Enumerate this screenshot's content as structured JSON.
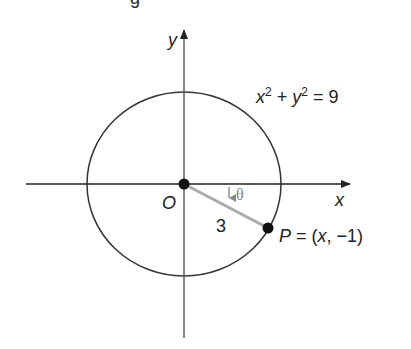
{
  "diagram": {
    "top_partial_glyph": "g",
    "axes": {
      "x_label": "x",
      "y_label": "y"
    },
    "origin_label": "O",
    "equation": {
      "base1": "x",
      "exp1": "2",
      "plus": " + ",
      "base2": "y",
      "exp2": "2",
      "rhs": " = 9"
    },
    "radius_label": "3",
    "angle_label": "θ",
    "point": {
      "name": "P",
      "eq": " = (",
      "x": "x",
      "sep": ", −1)"
    },
    "colors": {
      "stroke": "#222222",
      "radius_segment": "#aaaaaa",
      "theta": "#888888"
    }
  }
}
